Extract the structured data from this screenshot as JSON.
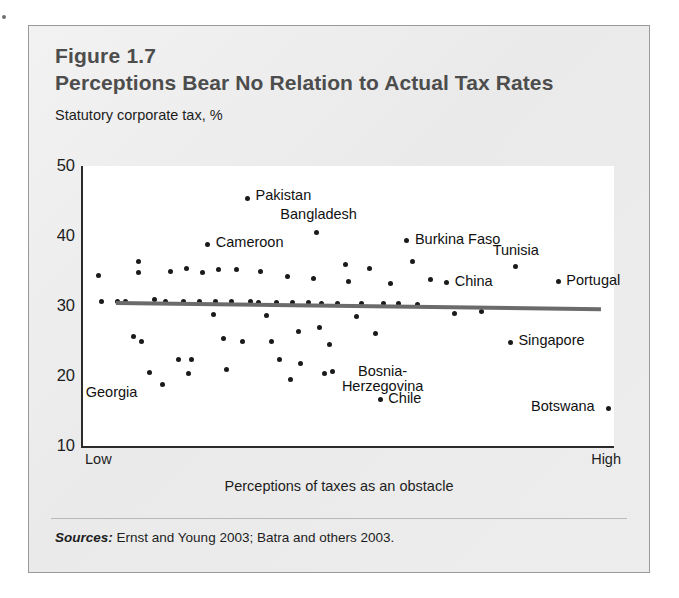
{
  "figure": {
    "number": "Figure 1.7",
    "title": "Perceptions Bear No Relation to Actual Tax Rates",
    "y_axis_title": "Statutory corporate tax, %",
    "x_axis_title": "Perceptions of taxes as an obstacle",
    "x_low_label": "Low",
    "x_high_label": "High",
    "source_lead": "Sources:",
    "source_text": "Ernst and Young 2003; Batra and others 2003.",
    "accent_color": "#4d4d4d",
    "dot_color": "#1a1a1a",
    "trend_color": "#6b6b6b",
    "panel_color": "#eeeeee",
    "plot_color": "#ffffff"
  },
  "chart_data": {
    "type": "scatter",
    "title": "Perceptions Bear No Relation to Actual Tax Rates",
    "subtitle": "Figure 1.7",
    "xlabel": "Perceptions of taxes as an obstacle",
    "ylabel": "Statutory corporate tax, %",
    "xlim": [
      0,
      100
    ],
    "ylim": [
      10,
      50
    ],
    "yticks": [
      10,
      20,
      30,
      40,
      50
    ],
    "xtick_labels": [
      "Low",
      "High"
    ],
    "grid": false,
    "legend": "none",
    "trend": {
      "name": "fitted regression line",
      "x_start": 6.2,
      "y_start": 30.5,
      "x_end": 97.5,
      "y_end": 29.6
    },
    "labeled_points": [
      {
        "label": "Pakistan",
        "x": 31.0,
        "y": 45.4
      },
      {
        "label": "Bangladesh",
        "x": 44.0,
        "y": 40.5
      },
      {
        "label": "Cameroon",
        "x": 23.5,
        "y": 38.8
      },
      {
        "label": "Burkina Faso",
        "x": 61.0,
        "y": 39.3
      },
      {
        "label": "Tunisia",
        "x": 81.5,
        "y": 35.6
      },
      {
        "label": "Portugal",
        "x": 89.5,
        "y": 33.5
      },
      {
        "label": "China",
        "x": 68.5,
        "y": 33.3
      },
      {
        "label": "Singapore",
        "x": 80.5,
        "y": 24.8
      },
      {
        "label": "Botswana",
        "x": 99.0,
        "y": 15.4
      },
      {
        "label": "Chile",
        "x": 56.0,
        "y": 16.6
      },
      {
        "label": "Bosnia-Herzegovina",
        "x": 45.5,
        "y": 20.4
      },
      {
        "label": "Georgia",
        "x": 12.5,
        "y": 20.5
      }
    ],
    "unlabeled_points": [
      {
        "x": 3.0,
        "y": 34.4
      },
      {
        "x": 3.5,
        "y": 30.6
      },
      {
        "x": 10.5,
        "y": 36.4
      },
      {
        "x": 10.5,
        "y": 34.8
      },
      {
        "x": 8.0,
        "y": 30.6
      },
      {
        "x": 9.5,
        "y": 25.6
      },
      {
        "x": 11.0,
        "y": 24.9
      },
      {
        "x": 16.5,
        "y": 35.0
      },
      {
        "x": 15.5,
        "y": 30.6
      },
      {
        "x": 15.0,
        "y": 18.8
      },
      {
        "x": 19.5,
        "y": 35.3
      },
      {
        "x": 19.0,
        "y": 30.6
      },
      {
        "x": 18.0,
        "y": 22.3
      },
      {
        "x": 20.5,
        "y": 22.4
      },
      {
        "x": 19.8,
        "y": 20.3
      },
      {
        "x": 22.5,
        "y": 34.8
      },
      {
        "x": 22.0,
        "y": 30.6
      },
      {
        "x": 24.5,
        "y": 28.8
      },
      {
        "x": 25.5,
        "y": 35.2
      },
      {
        "x": 25.0,
        "y": 30.6
      },
      {
        "x": 26.5,
        "y": 25.3
      },
      {
        "x": 28.0,
        "y": 30.6
      },
      {
        "x": 29.0,
        "y": 35.2
      },
      {
        "x": 30.0,
        "y": 24.9
      },
      {
        "x": 31.5,
        "y": 30.6
      },
      {
        "x": 33.5,
        "y": 34.9
      },
      {
        "x": 33.0,
        "y": 30.5
      },
      {
        "x": 34.5,
        "y": 28.6
      },
      {
        "x": 35.5,
        "y": 24.9
      },
      {
        "x": 36.5,
        "y": 30.5
      },
      {
        "x": 37.0,
        "y": 22.3
      },
      {
        "x": 38.5,
        "y": 34.2
      },
      {
        "x": 39.5,
        "y": 30.5
      },
      {
        "x": 40.5,
        "y": 26.4
      },
      {
        "x": 41.0,
        "y": 21.8
      },
      {
        "x": 42.5,
        "y": 30.5
      },
      {
        "x": 43.5,
        "y": 33.9
      },
      {
        "x": 44.5,
        "y": 27.0
      },
      {
        "x": 45.0,
        "y": 30.4
      },
      {
        "x": 46.5,
        "y": 24.5
      },
      {
        "x": 48.0,
        "y": 30.4
      },
      {
        "x": 49.5,
        "y": 36.0
      },
      {
        "x": 50.0,
        "y": 33.5
      },
      {
        "x": 51.5,
        "y": 28.5
      },
      {
        "x": 52.5,
        "y": 30.4
      },
      {
        "x": 54.0,
        "y": 35.3
      },
      {
        "x": 55.0,
        "y": 26.1
      },
      {
        "x": 56.5,
        "y": 30.3
      },
      {
        "x": 58.0,
        "y": 33.2
      },
      {
        "x": 59.5,
        "y": 30.3
      },
      {
        "x": 62.0,
        "y": 36.3
      },
      {
        "x": 63.0,
        "y": 30.2
      },
      {
        "x": 65.5,
        "y": 33.8
      },
      {
        "x": 70.0,
        "y": 28.9
      },
      {
        "x": 75.0,
        "y": 29.2
      },
      {
        "x": 13.5,
        "y": 31.0
      },
      {
        "x": 6.5,
        "y": 30.6
      },
      {
        "x": 27.0,
        "y": 20.9
      },
      {
        "x": 47.0,
        "y": 20.7
      },
      {
        "x": 39.0,
        "y": 19.5
      }
    ]
  }
}
